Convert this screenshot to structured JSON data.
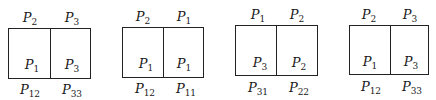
{
  "panels": [
    {
      "top_labels": [
        "P",
        "P"
      ],
      "top_subs": [
        "2",
        "3"
      ],
      "inner_labels": [
        "P",
        "P"
      ],
      "inner_subs": [
        "1",
        "3"
      ],
      "bottom_labels": [
        "P",
        "P"
      ],
      "bottom_subs": [
        "12",
        "33"
      ]
    },
    {
      "top_labels": [
        "P",
        "P"
      ],
      "top_subs": [
        "2",
        "1"
      ],
      "inner_labels": [
        "P",
        "P"
      ],
      "inner_subs": [
        "1",
        "1"
      ],
      "bottom_labels": [
        "P",
        "P"
      ],
      "bottom_subs": [
        "12",
        "11"
      ]
    },
    {
      "top_labels": [
        "P",
        "P"
      ],
      "top_subs": [
        "1",
        "2"
      ],
      "inner_labels": [
        "P",
        "P"
      ],
      "inner_subs": [
        "3",
        "2"
      ],
      "bottom_labels": [
        "P",
        "P"
      ],
      "bottom_subs": [
        "31",
        "22"
      ]
    },
    {
      "top_labels": [
        "P",
        "P"
      ],
      "top_subs": [
        "2",
        "3"
      ],
      "inner_labels": [
        "P",
        "P"
      ],
      "inner_subs": [
        "1",
        "3"
      ],
      "bottom_labels": [
        "P",
        "P"
      ],
      "bottom_subs": [
        "12",
        "33"
      ]
    }
  ]
}
